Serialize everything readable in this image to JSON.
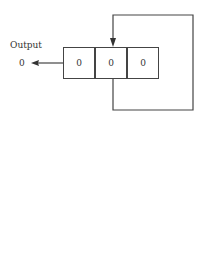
{
  "diagram": {
    "output_label": "Output",
    "output_value": "0",
    "cells": [
      "0",
      "0",
      "0"
    ],
    "line_color": "#444444"
  }
}
